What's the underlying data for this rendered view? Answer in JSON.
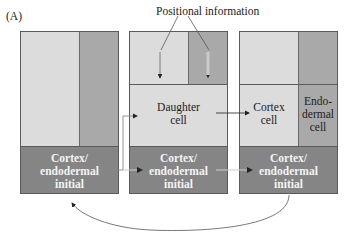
{
  "figure": {
    "panel_label": "(A)",
    "annotation": "Positional information",
    "colors": {
      "light": "#dcdcdc",
      "medium": "#a9a9a9",
      "dark": "#858585",
      "border": "#5a5a5a",
      "arrow": "#333333"
    },
    "panels": [
      {
        "id": 1,
        "initial_label_lines": [
          "Cortex/",
          "endodermal",
          "initial"
        ]
      },
      {
        "id": 2,
        "daughter_label_lines": [
          "Daughter",
          "cell"
        ],
        "initial_label_lines": [
          "Cortex/",
          "endodermal",
          "initial"
        ]
      },
      {
        "id": 3,
        "cortex_label_lines": [
          "Cortex",
          "cell"
        ],
        "endodermal_label_lines": [
          "Endo-",
          "dermal",
          "cell"
        ],
        "initial_label_lines": [
          "Cortex/",
          "endodermal",
          "initial"
        ]
      }
    ]
  }
}
